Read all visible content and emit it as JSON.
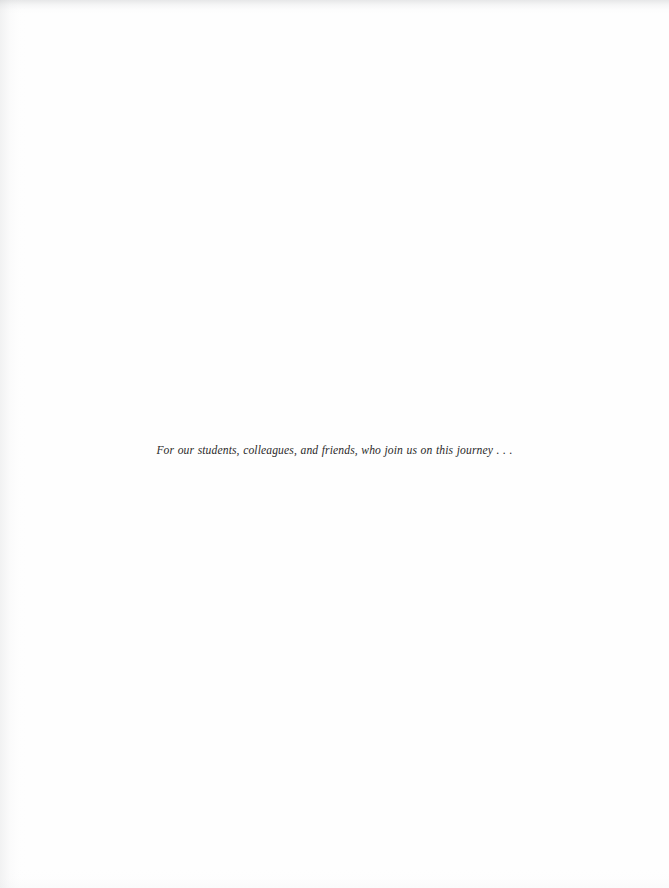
{
  "page": {
    "kind": "book-dedication-page",
    "background_color": "#fefefe",
    "width": 669,
    "height": 888
  },
  "dedication": {
    "text": "For our students, colleagues, and friends, who join us on this journey . . .",
    "text_color": "#2b2a2a",
    "style": "italic-serif"
  }
}
